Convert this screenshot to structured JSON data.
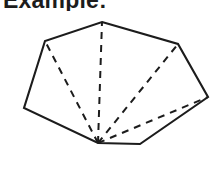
{
  "page": {
    "width": 219,
    "height": 196,
    "background_color": "#ffffff",
    "ink_color": "#1c1c1c"
  },
  "caption": {
    "text": "Example:",
    "visible_fragment": "sample:",
    "note": "top of text is cropped off by the image edge",
    "color": "#1c1c1c"
  },
  "figure": {
    "name": "heptagon-triangulation",
    "shape_label": "heptagon",
    "side_count": 7,
    "diagonal_count": 4,
    "triangle_count": 5,
    "outline": {
      "stroke_color": "#1c1c1c",
      "stroke_width": 2.1,
      "fill": "none",
      "style": "solid"
    },
    "diagonals": {
      "stroke_color": "#1c1c1c",
      "stroke_width": 2.0,
      "style": "dashed",
      "dash_pattern": "7 6",
      "origin_vertex": "apex"
    },
    "vertices": [
      {
        "id": "top",
        "label": "A",
        "x": 102,
        "y": 22
      },
      {
        "id": "upper-right",
        "label": "B",
        "x": 178,
        "y": 44
      },
      {
        "id": "right",
        "label": "C",
        "x": 208,
        "y": 97
      },
      {
        "id": "lower-right",
        "label": "D",
        "x": 140,
        "y": 144
      },
      {
        "id": "apex",
        "label": "E",
        "x": 98,
        "y": 143
      },
      {
        "id": "left",
        "label": "F",
        "x": 24,
        "y": 108
      },
      {
        "id": "upper-left",
        "label": "G",
        "x": 45,
        "y": 41
      }
    ],
    "outline_path": "M 102 22 L 178 44 L 208 97 L 140 144 L 98 143 L 24 108 L 45 41 Z",
    "diagonal_segments": [
      {
        "name": "apex-to-upper-left",
        "x1": 98,
        "y1": 143,
        "x2": 45,
        "y2": 41
      },
      {
        "name": "apex-to-top",
        "x1": 98,
        "y1": 143,
        "x2": 102,
        "y2": 22
      },
      {
        "name": "apex-to-upper-right",
        "x1": 98,
        "y1": 143,
        "x2": 178,
        "y2": 44
      },
      {
        "name": "apex-to-right",
        "x1": 98,
        "y1": 143,
        "x2": 208,
        "y2": 97
      }
    ]
  }
}
